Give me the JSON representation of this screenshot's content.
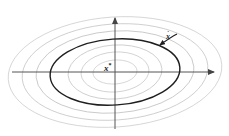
{
  "figure": {
    "type": "contour-plot",
    "title": "",
    "background_color": "#ffffff",
    "center_label": "x",
    "center_label_superscript": "*",
    "vector_label": "x",
    "vector_label_diacritic": "˙",
    "axis_color": "#555555",
    "contour_color": "#b9b9b9",
    "highlight_contour_color": "#1f1f1f",
    "vector_color": "#1f1f1f"
  },
  "axes": {
    "origin": {
      "x": 115,
      "y": 72
    },
    "x_axis": {
      "x_start": 12,
      "x_end": 220,
      "y": 72,
      "arrow": "right",
      "arrow_name": "x-axis-arrowhead"
    },
    "y_axis": {
      "y_start": 13,
      "y_end": 129,
      "x": 115,
      "arrow": "up",
      "arrow_name": "y-axis-arrowhead"
    }
  },
  "chart_data": {
    "type": "contour",
    "title": "",
    "xlabel": "",
    "ylabel": "",
    "grid": false,
    "legend": null,
    "center": {
      "cx": 115,
      "cy": 72,
      "label": "x*"
    },
    "contours": [
      {
        "level": 1,
        "rx": 22,
        "ry": 12,
        "stroke": "#c8c8c8",
        "width": 0.7,
        "highlight": false
      },
      {
        "level": 2,
        "rx": 34,
        "ry": 20,
        "stroke": "#c2c2c2",
        "width": 0.7,
        "highlight": false
      },
      {
        "level": 3,
        "rx": 47,
        "ry": 27,
        "stroke": "#bcbcbc",
        "width": 0.7,
        "highlight": false
      },
      {
        "level": 4,
        "rx": 65,
        "ry": 33,
        "stroke": "#1f1f1f",
        "width": 1.4,
        "highlight": true
      },
      {
        "level": 5,
        "rx": 79,
        "ry": 41,
        "stroke": "#b6b6b6",
        "width": 0.7,
        "highlight": false
      },
      {
        "level": 6,
        "rx": 93,
        "ry": 48,
        "stroke": "#bdbdbd",
        "width": 0.7,
        "highlight": false
      },
      {
        "level": 7,
        "rx": 107,
        "ry": 55,
        "stroke": "#c6c6c6",
        "width": 0.7,
        "highlight": false
      }
    ],
    "contour_tilt_deg": -4,
    "annotations": [
      {
        "name": "tangent-vector",
        "label": "x˙",
        "tail": {
          "x": 176,
          "y": 35
        },
        "head": {
          "x": 155,
          "y": 48
        },
        "curved": true,
        "label_position": {
          "x": 166,
          "y": 31
        }
      }
    ]
  }
}
